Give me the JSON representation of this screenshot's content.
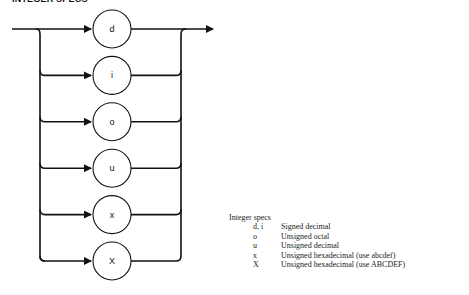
{
  "title": "INTEGER SPECS",
  "diagram": {
    "type": "syntax-railroad",
    "nodes": [
      {
        "label": "d"
      },
      {
        "label": "i"
      },
      {
        "label": "o"
      },
      {
        "label": "u"
      },
      {
        "label": "x"
      },
      {
        "label": "X"
      }
    ],
    "line_color": "#111111"
  },
  "legend": {
    "title": "Integer specs",
    "rows": [
      {
        "code": "d, i",
        "desc": "Signed decimal"
      },
      {
        "code": "o",
        "desc": "Unsigned octal"
      },
      {
        "code": "u",
        "desc": "Unsigned decimal"
      },
      {
        "code": "x",
        "desc": "Unsigned hexadecimal (use abcdef)"
      },
      {
        "code": "X",
        "desc": "Unsigned hexadecimal (use ABCDEF)"
      }
    ]
  }
}
